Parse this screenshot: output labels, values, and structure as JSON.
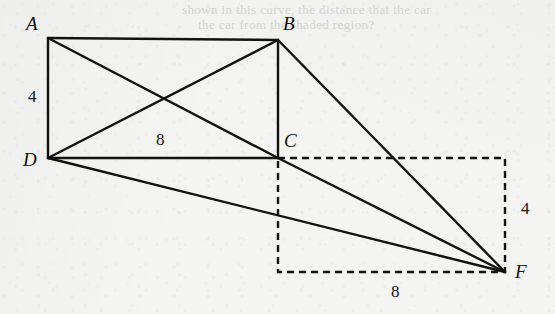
{
  "figure": {
    "background_color": "#f4f4f3",
    "stroke_color": "#121212",
    "canvas": {
      "width": 555,
      "height": 314
    },
    "vertices": [
      {
        "id": "A",
        "label": "A",
        "x": 48,
        "y": 38,
        "label_x": 26,
        "label_y": 14
      },
      {
        "id": "B",
        "label": "B",
        "x": 278,
        "y": 40,
        "label_x": 283,
        "label_y": 14
      },
      {
        "id": "C",
        "label": "C",
        "x": 278,
        "y": 158,
        "label_x": 284,
        "label_y": 131
      },
      {
        "id": "D",
        "label": "D",
        "x": 48,
        "y": 158,
        "label_x": 23,
        "label_y": 150
      },
      {
        "id": "F",
        "label": "F",
        "x": 505,
        "y": 272,
        "label_x": 515,
        "label_y": 262
      }
    ],
    "solid_edges": [
      {
        "name": "edge-AB",
        "from": "A",
        "to": "B"
      },
      {
        "name": "edge-BC",
        "from": "B",
        "to": "C"
      },
      {
        "name": "edge-DC",
        "from": "D",
        "to": "C"
      },
      {
        "name": "edge-AD",
        "from": "A",
        "to": "D"
      },
      {
        "name": "diagonal-AC",
        "from": "A",
        "to": "C"
      },
      {
        "name": "diagonal-DB",
        "from": "D",
        "to": "B"
      },
      {
        "name": "line-BF",
        "from": "B",
        "to": "F"
      },
      {
        "name": "line-CF",
        "from": "C",
        "to": "F"
      },
      {
        "name": "line-DF",
        "from": "D",
        "to": "F"
      }
    ],
    "dashed_rectangle": {
      "name": "dashed-rectangle-CF",
      "x": 278,
      "y": 158,
      "width": 227,
      "height": 114,
      "corner_top_left": "C",
      "corner_bottom_right": "F"
    },
    "dimension_labels": [
      {
        "name": "dimension-label-ad",
        "text": "4",
        "x": 28,
        "y": 88,
        "measures": "AD"
      },
      {
        "name": "dimension-label-dc",
        "text": "8",
        "x": 156,
        "y": 131,
        "measures": "DC"
      },
      {
        "name": "dimension-label-right",
        "text": "4",
        "x": 521,
        "y": 200,
        "measures": "right side of dashed rectangle"
      },
      {
        "name": "dimension-label-bottom",
        "text": "8",
        "x": 391,
        "y": 283,
        "measures": "bottom of dashed rectangle"
      }
    ],
    "bleed_through_text": [
      {
        "text": "shown in this curve, the distance that the car",
        "x": 182,
        "y": 2
      },
      {
        "text": "the car from the shaded region?",
        "x": 198,
        "y": 17
      }
    ]
  }
}
